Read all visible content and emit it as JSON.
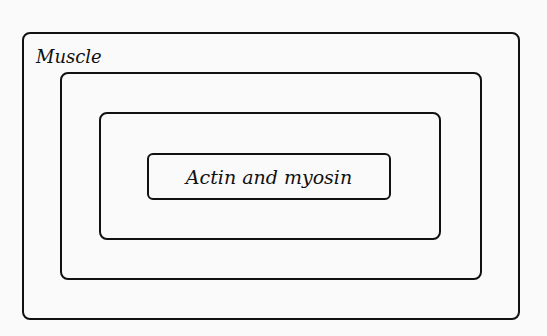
{
  "diagram": {
    "type": "nested-boxes",
    "levels": [
      {
        "label": "Muscle"
      },
      {
        "label": ""
      },
      {
        "label": ""
      },
      {
        "label": "Actin and myosin"
      }
    ],
    "colors": {
      "stroke": "#111111",
      "background": "#fafafa"
    }
  }
}
